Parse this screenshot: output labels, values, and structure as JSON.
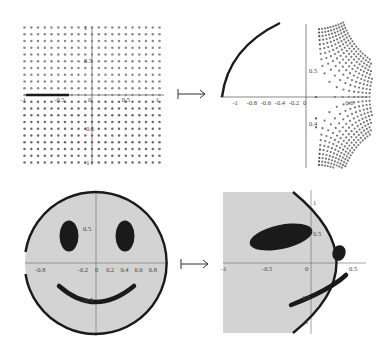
{
  "figure": {
    "colors": {
      "dot": "#7a7a7a",
      "ink": "#1a1a1a",
      "axis": "#555555",
      "fill": "#d3d3d3"
    },
    "arrow_symbol": "↦",
    "panels": {
      "top_left": {
        "title": "dotted square grid with slit",
        "x_ticks": [
          "-1",
          "-0.5",
          "0",
          "0.5",
          "1"
        ],
        "y_ticks": [
          "1",
          "0.5",
          "-0.5",
          "-1"
        ]
      },
      "top_right": {
        "title": "mapped dotted grid",
        "x_ticks": [
          "-1",
          "-0.8",
          "-0.6",
          "-0.4",
          "-0.2",
          "0",
          "0.6"
        ],
        "y_ticks": [
          "0.5",
          "0.4"
        ]
      },
      "bottom_left": {
        "title": "smiley face in unit disk",
        "x_ticks": [
          "-0.8",
          "-0.2",
          "0",
          "0.2",
          "0.4",
          "0.6",
          "0.8"
        ],
        "y_ticks": [
          "0.5",
          "-0.5"
        ]
      },
      "bottom_right": {
        "title": "mapped smiley face",
        "x_ticks": [
          "-1",
          "-0.5",
          "0",
          "0.5"
        ],
        "y_ticks": [
          "1",
          "0.5",
          "-0.5",
          "-1"
        ]
      }
    }
  }
}
